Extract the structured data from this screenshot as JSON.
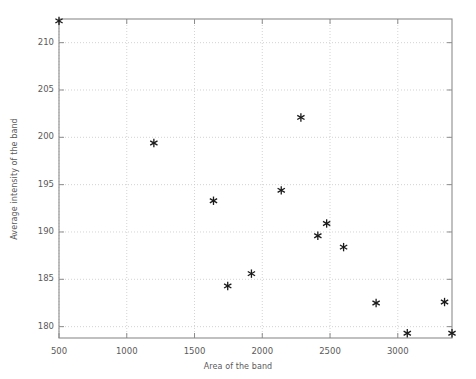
{
  "chart_data": {
    "type": "scatter",
    "title": "",
    "xlabel": "Area of the band",
    "ylabel": "Average intensity of the band",
    "xlim": [
      500,
      3400
    ],
    "ylim": [
      178.8,
      212.5
    ],
    "xticks": [
      500,
      1000,
      1500,
      2000,
      2500,
      3000
    ],
    "xtick_labels": [
      "500",
      "1000",
      "1500",
      "2000",
      "2500",
      "3000"
    ],
    "yticks": [
      180,
      185,
      190,
      195,
      200,
      205,
      210
    ],
    "ytick_labels": [
      "180",
      "185",
      "190",
      "195",
      "200",
      "205",
      "210"
    ],
    "grid": true,
    "grid_style": "dotted",
    "marker": "asterisk",
    "marker_color": "#1a1a1a",
    "series": [
      {
        "name": "bands",
        "x": [
          500,
          1200,
          1640,
          1745,
          1920,
          2140,
          2285,
          2410,
          2475,
          2600,
          2840,
          3070,
          3345,
          3400
        ],
        "y": [
          212.3,
          199.4,
          193.3,
          184.3,
          185.6,
          194.4,
          202.1,
          189.6,
          190.9,
          188.4,
          182.5,
          179.3,
          182.6,
          179.3
        ]
      }
    ],
    "axis_color": "#8c8c8c",
    "grid_color": "#c8c8c8",
    "text_color": "#5a5a5a",
    "background": "#ffffff"
  },
  "plot_box": {
    "left": 59,
    "top": 19,
    "right": 452,
    "bottom": 338
  }
}
